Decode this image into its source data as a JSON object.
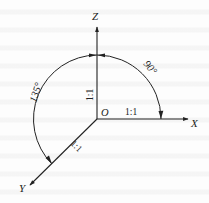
{
  "diagram": {
    "type": "axonometric axes",
    "axes": {
      "x": {
        "label": "X",
        "scale": "1:1"
      },
      "y": {
        "label": "Y",
        "scale": "1:1"
      },
      "z": {
        "label": "Z",
        "scale": "1:1"
      }
    },
    "origin_label": "O",
    "angles": {
      "xz": "90°",
      "yz": "135°"
    },
    "colors": {
      "line": "#222222",
      "background": "#fdfdfd"
    }
  }
}
